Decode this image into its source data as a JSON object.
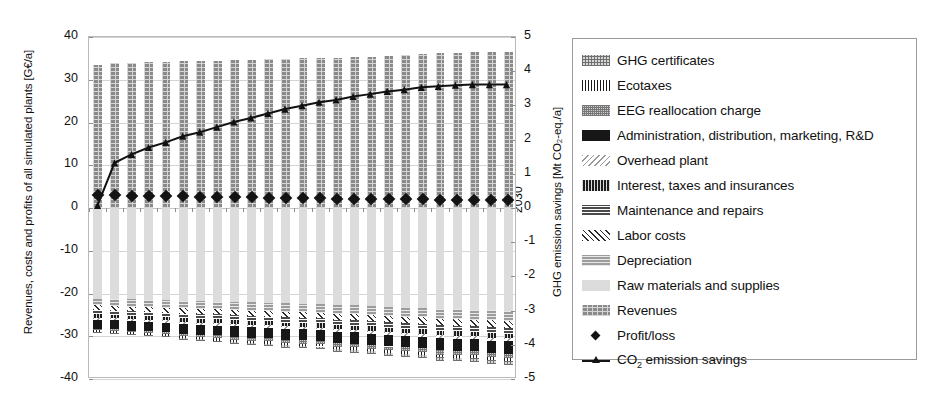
{
  "chart_data": {
    "type": "bar",
    "title": "",
    "subtitle": "",
    "xlabel": "",
    "ylabel": "Revenues, costs and profits of all simulated plants [G€/a]",
    "y2label": "GHG emission savings [Mt CO₂-eq./a]",
    "ylim": [
      -40,
      40
    ],
    "y2lim": [
      -5,
      5
    ],
    "yticks": [
      40,
      30,
      20,
      10,
      0,
      -10,
      -20,
      -30,
      -40
    ],
    "y2ticks": [
      5,
      4,
      3,
      2,
      1,
      0,
      -1,
      -2,
      -3,
      -4,
      -5
    ],
    "grid": true,
    "legend_position": "right",
    "stacked": true,
    "categories": [
      2006,
      2007,
      2008,
      2009,
      2010,
      2011,
      2012,
      2013,
      2014,
      2015,
      2016,
      2017,
      2018,
      2019,
      2020,
      2021,
      2022,
      2023,
      2024,
      2025,
      2026,
      2027,
      2028,
      2029,
      2030
    ],
    "xtick_labels": [
      "2006",
      "2008",
      "2010",
      "2012",
      "2014",
      "2016",
      "2018",
      "2020",
      "2022",
      "2024",
      "2026",
      "2028",
      "2030"
    ],
    "series": [
      {
        "name": "Revenues",
        "pattern": "p-rev",
        "sign": "positive",
        "values": [
          33.5,
          33.9,
          34.0,
          34.1,
          34.2,
          34.3,
          34.4,
          34.5,
          34.6,
          34.7,
          34.8,
          34.9,
          35.0,
          35.1,
          35.2,
          35.3,
          35.4,
          35.6,
          35.8,
          36.0,
          36.2,
          36.3,
          36.4,
          36.5,
          36.6
        ]
      },
      {
        "name": "Raw materials and supplies",
        "pattern": "p-raw",
        "sign": "negative",
        "values": [
          -21.2,
          -21.3,
          -21.4,
          -21.5,
          -21.6,
          -21.7,
          -21.8,
          -21.9,
          -22.0,
          -22.1,
          -22.2,
          -22.3,
          -22.4,
          -22.5,
          -22.7,
          -22.8,
          -23.0,
          -23.1,
          -23.3,
          -23.4,
          -23.6,
          -23.7,
          -23.8,
          -23.9,
          -24.0
        ]
      },
      {
        "name": "Depreciation",
        "pattern": "p-depr",
        "sign": "negative",
        "values": [
          -1.6,
          -1.6,
          -1.7,
          -1.7,
          -1.7,
          -1.8,
          -1.8,
          -1.8,
          -1.9,
          -1.9,
          -1.9,
          -2.0,
          -2.0,
          -2.0,
          -2.1,
          -2.1,
          -2.1,
          -2.2,
          -2.2,
          -2.2,
          -2.3,
          -2.3,
          -2.3,
          -2.4,
          -2.4
        ]
      },
      {
        "name": "Labor costs",
        "pattern": "p-labor",
        "sign": "negative",
        "values": [
          -1.1,
          -1.1,
          -1.1,
          -1.1,
          -1.2,
          -1.2,
          -1.2,
          -1.2,
          -1.2,
          -1.3,
          -1.3,
          -1.3,
          -1.3,
          -1.3,
          -1.4,
          -1.4,
          -1.4,
          -1.4,
          -1.4,
          -1.5,
          -1.5,
          -1.5,
          -1.5,
          -1.5,
          -1.6
        ]
      },
      {
        "name": "Maintenance and repairs",
        "pattern": "p-maint",
        "sign": "negative",
        "values": [
          -1.0,
          -1.0,
          -1.0,
          -1.0,
          -1.0,
          -1.1,
          -1.1,
          -1.1,
          -1.1,
          -1.1,
          -1.1,
          -1.2,
          -1.2,
          -1.2,
          -1.2,
          -1.2,
          -1.2,
          -1.3,
          -1.3,
          -1.3,
          -1.3,
          -1.3,
          -1.3,
          -1.4,
          -1.4
        ]
      },
      {
        "name": "Interest, taxes and insurances",
        "pattern": "p-interest",
        "sign": "negative",
        "values": [
          -0.8,
          -0.8,
          -0.8,
          -0.8,
          -0.8,
          -0.8,
          -0.9,
          -0.9,
          -0.9,
          -0.9,
          -0.9,
          -0.9,
          -0.9,
          -1.0,
          -1.0,
          -1.0,
          -1.0,
          -1.0,
          -1.0,
          -1.0,
          -1.1,
          -1.1,
          -1.1,
          -1.1,
          -1.1
        ]
      },
      {
        "name": "Overhead plant",
        "pattern": "p-overhead",
        "sign": "negative",
        "values": [
          -0.5,
          -0.5,
          -0.5,
          -0.5,
          -0.5,
          -0.5,
          -0.5,
          -0.6,
          -0.6,
          -0.6,
          -0.6,
          -0.6,
          -0.6,
          -0.6,
          -0.6,
          -0.6,
          -0.7,
          -0.7,
          -0.7,
          -0.7,
          -0.7,
          -0.7,
          -0.7,
          -0.7,
          -0.7
        ]
      },
      {
        "name": "Administration, distribution, marketing, R&D",
        "pattern": "p-admin",
        "sign": "negative",
        "values": [
          -2.1,
          -2.1,
          -2.2,
          -2.2,
          -2.2,
          -2.3,
          -2.3,
          -2.3,
          -2.4,
          -2.4,
          -2.4,
          -2.5,
          -2.5,
          -2.5,
          -2.6,
          -2.6,
          -2.6,
          -2.7,
          -2.7,
          -2.7,
          -2.8,
          -2.8,
          -2.8,
          -2.9,
          -2.9
        ]
      },
      {
        "name": "EEG reallocation charge",
        "pattern": "p-eeg",
        "sign": "negative",
        "values": [
          -0.3,
          -0.4,
          -0.4,
          -0.5,
          -0.5,
          -0.6,
          -0.6,
          -0.7,
          -0.7,
          -0.7,
          -0.8,
          -0.8,
          -0.8,
          -0.8,
          -0.9,
          -0.9,
          -0.9,
          -0.9,
          -0.9,
          -1.0,
          -1.0,
          -1.0,
          -1.0,
          -1.0,
          -1.0
        ]
      },
      {
        "name": "Ecotaxes",
        "pattern": "p-eco",
        "sign": "negative",
        "values": [
          -0.4,
          -0.4,
          -0.4,
          -0.4,
          -0.4,
          -0.4,
          -0.5,
          -0.5,
          -0.5,
          -0.5,
          -0.5,
          -0.5,
          -0.5,
          -0.5,
          -0.5,
          -0.6,
          -0.6,
          -0.6,
          -0.6,
          -0.6,
          -0.6,
          -0.6,
          -0.6,
          -0.6,
          -0.6
        ]
      },
      {
        "name": "GHG certificates",
        "pattern": "p-ghg",
        "sign": "negative",
        "values": [
          -0.2,
          -0.2,
          -0.3,
          -0.3,
          -0.3,
          -0.4,
          -0.4,
          -0.4,
          -0.5,
          -0.5,
          -0.5,
          -0.6,
          -0.6,
          -0.6,
          -0.7,
          -0.7,
          -0.7,
          -0.8,
          -0.8,
          -0.8,
          -0.9,
          -0.9,
          -0.9,
          -1.0,
          -1.0
        ]
      }
    ],
    "markers": {
      "name": "Profit/loss",
      "axis": "left",
      "values": [
        3.0,
        3.0,
        2.9,
        2.8,
        2.8,
        2.7,
        2.6,
        2.6,
        2.5,
        2.5,
        2.4,
        2.4,
        2.3,
        2.3,
        2.2,
        2.2,
        2.1,
        2.1,
        2.0,
        2.0,
        1.9,
        1.9,
        1.8,
        1.8,
        1.8
      ]
    },
    "line": {
      "name": "CO₂ emission savings",
      "axis": "right",
      "values": [
        0.05,
        1.3,
        1.55,
        1.75,
        1.9,
        2.08,
        2.2,
        2.35,
        2.5,
        2.62,
        2.75,
        2.88,
        2.98,
        3.08,
        3.15,
        3.25,
        3.32,
        3.4,
        3.45,
        3.52,
        3.55,
        3.58,
        3.6,
        3.6,
        3.6
      ]
    }
  },
  "legend": {
    "items": [
      {
        "label": "GHG certificates",
        "swatch": "p-ghg",
        "kind": "patch"
      },
      {
        "label": "Ecotaxes",
        "swatch": "p-eco",
        "kind": "patch"
      },
      {
        "label": "EEG reallocation charge",
        "swatch": "p-eeg",
        "kind": "patch"
      },
      {
        "label": "Administration, distribution, marketing, R&D",
        "swatch": "p-admin",
        "kind": "patch"
      },
      {
        "label": "Overhead plant",
        "swatch": "p-overhead",
        "kind": "patch"
      },
      {
        "label": "Interest, taxes and insurances",
        "swatch": "p-interest",
        "kind": "patch"
      },
      {
        "label": "Maintenance and repairs",
        "swatch": "p-maint",
        "kind": "patch"
      },
      {
        "label": "Labor costs",
        "swatch": "p-labor",
        "kind": "patch"
      },
      {
        "label": "Depreciation",
        "swatch": "p-depr",
        "kind": "patch"
      },
      {
        "label": "Raw materials and supplies",
        "swatch": "p-raw",
        "kind": "patch"
      },
      {
        "label": "Revenues",
        "swatch": "p-rev",
        "kind": "patch"
      },
      {
        "label": "Profit/loss",
        "swatch": "",
        "kind": "marker"
      },
      {
        "label": "CO2 emission savings",
        "swatch": "",
        "kind": "line"
      }
    ]
  }
}
